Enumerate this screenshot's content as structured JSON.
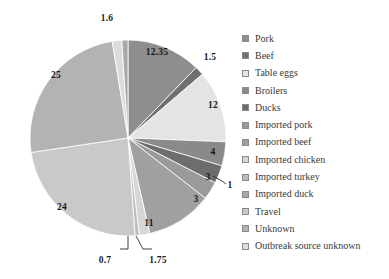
{
  "chart_data": {
    "type": "pie",
    "title": "",
    "subtitle": "",
    "xlabel": "",
    "ylabel": "",
    "grid": false,
    "legend_position": "right",
    "start_angle_deg": 0,
    "direction": "clockwise",
    "categories": [
      "Pork",
      "Beef",
      "Table eggs",
      "Broilers",
      "Ducks",
      "Imported pork",
      "Imported beef",
      "Imported chicken",
      "Imported turkey",
      "Imported duck",
      "Travel",
      "Unknown",
      "Outbreak source unknown"
    ],
    "values": [
      12.35,
      1.5,
      12,
      4,
      3,
      3,
      11,
      1.75,
      0.7,
      24,
      25,
      1.6,
      1
    ],
    "data_labels": [
      "12.35",
      "1.5",
      "12",
      "4",
      "3",
      "3",
      "11",
      "1.75",
      "0.7",
      "24",
      "25",
      "1.6",
      "1"
    ],
    "colors": [
      "#8e8e8e",
      "#6f6f6f",
      "#e4e4e4",
      "#8a8a8a",
      "#6d6d6d",
      "#9a9a9a",
      "#a0a0a0",
      "#d6d6d6",
      "#bdbdbd",
      "#c9c9c9",
      "#b3b3b3",
      "#dcdcdc",
      "#a8a8a8"
    ],
    "total": 100.9,
    "units": "percent"
  },
  "legend": {
    "items": [
      {
        "label": "Pork",
        "color": "#8e8e8e"
      },
      {
        "label": "Beef",
        "color": "#6f6f6f"
      },
      {
        "label": "Table eggs",
        "color": "#e4e4e4"
      },
      {
        "label": "Broilers",
        "color": "#8a8a8a"
      },
      {
        "label": "Ducks",
        "color": "#6d6d6d"
      },
      {
        "label": "Imported pork",
        "color": "#9a9a9a"
      },
      {
        "label": "Imported beef",
        "color": "#a0a0a0"
      },
      {
        "label": "Imported chicken",
        "color": "#d6d6d6"
      },
      {
        "label": "Imported turkey",
        "color": "#bdbdbd"
      },
      {
        "label": "Imported duck",
        "color": "#a8a8a8"
      },
      {
        "label": "Travel",
        "color": "#c9c9c9"
      },
      {
        "label": "Unknown",
        "color": "#b3b3b3"
      },
      {
        "label": "Outbreak source unknown",
        "color": "#dcdcdc"
      }
    ]
  },
  "labels": {
    "l_1_6": {
      "text": "1.6",
      "x": 107,
      "y": 18
    },
    "l_12_35": {
      "text": "12.35",
      "x": 157,
      "y": 52
    },
    "l_1_5": {
      "text": "1.5",
      "x": 210,
      "y": 57
    },
    "l_12": {
      "text": "12",
      "x": 213,
      "y": 105
    },
    "l_4": {
      "text": "4",
      "x": 213,
      "y": 152
    },
    "l_3a": {
      "text": "3",
      "x": 208,
      "y": 177
    },
    "l_1": {
      "text": "1",
      "x": 230,
      "y": 185
    },
    "l_3b": {
      "text": "3",
      "x": 196,
      "y": 199
    },
    "l_11": {
      "text": "11",
      "x": 149,
      "y": 223
    },
    "l_1_75": {
      "text": "1.75",
      "x": 158,
      "y": 260
    },
    "l_0_7": {
      "text": "0.7",
      "x": 105,
      "y": 260
    },
    "l_24": {
      "text": "24",
      "x": 62,
      "y": 207
    },
    "l_25": {
      "text": "25",
      "x": 56,
      "y": 75
    }
  }
}
